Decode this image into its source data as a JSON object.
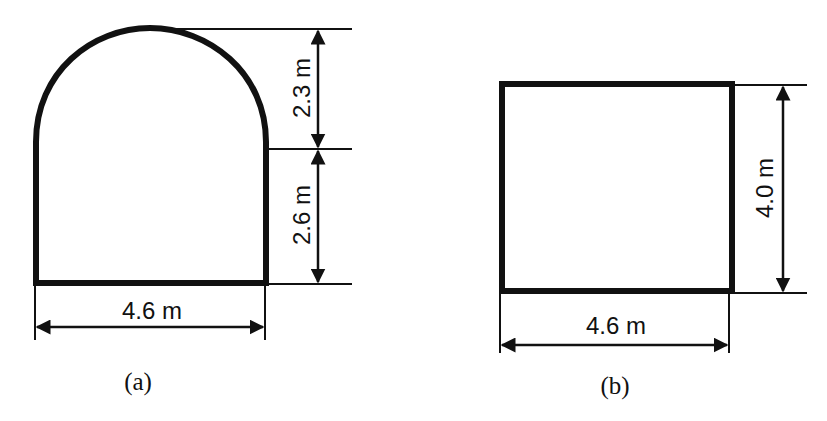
{
  "figures": [
    {
      "id": "a",
      "caption": "(a)",
      "shape": "horseshoe (semicircular arch on vertical walls)",
      "width_label": "4.6 m",
      "wall_height_label": "2.6 m",
      "arch_height_label": "2.3 m"
    },
    {
      "id": "b",
      "caption": "(b)",
      "shape": "rectangle",
      "width_label": "4.6 m",
      "height_label": "4.0 m"
    }
  ],
  "colors": {
    "stroke": "#111111",
    "background": "#ffffff"
  }
}
